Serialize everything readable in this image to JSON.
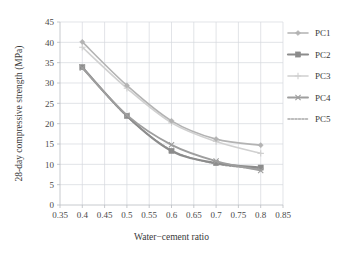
{
  "chart_data": {
    "type": "line",
    "title": "",
    "xlabel": "Water−cement ratio",
    "ylabel": "28-day compressive strength (MPa)",
    "xlim": [
      0.35,
      0.85
    ],
    "ylim": [
      0,
      45
    ],
    "xticks": [
      "0.35",
      "0.4",
      "0.45",
      "0.5",
      "0.55",
      "0.6",
      "0.65",
      "0.7",
      "0.75",
      "0.8",
      "0.85"
    ],
    "yticks": [
      "0",
      "5",
      "10",
      "15",
      "20",
      "25",
      "30",
      "35",
      "40",
      "45"
    ],
    "grid": true,
    "legend_position": "right",
    "x": [
      0.4,
      0.5,
      0.6,
      0.7,
      0.8
    ],
    "series": [
      {
        "name": "PC1",
        "values": [
          40.1,
          29.4,
          20.7,
          16.2,
          14.7
        ],
        "color": "#b3b3b3",
        "marker": "diamond",
        "dash": "none",
        "width": 1.6
      },
      {
        "name": "PC2",
        "values": [
          33.9,
          21.9,
          13.3,
          10.3,
          9.2
        ],
        "color": "#8c8c8c",
        "marker": "square",
        "dash": "none",
        "width": 2.2
      },
      {
        "name": "PC3",
        "values": [
          38.8,
          28.7,
          20.2,
          15.6,
          12.7
        ],
        "color": "#d0d0d0",
        "marker": "plus",
        "dash": "none",
        "width": 1.6
      },
      {
        "name": "PC4",
        "values": [
          33.7,
          22.1,
          14.8,
          10.8,
          8.5
        ],
        "color": "#9e9e9e",
        "marker": "cross",
        "dash": "none",
        "width": 1.9
      },
      {
        "name": "PC5",
        "values": [
          33.8,
          21.8,
          13.5,
          10.1,
          8.9
        ],
        "color": "#a8a8a8",
        "marker": "none",
        "dash": "2,1.5",
        "width": 1.5
      }
    ]
  },
  "legend": {
    "items": [
      {
        "label": "PC1"
      },
      {
        "label": "PC2"
      },
      {
        "label": "PC3"
      },
      {
        "label": "PC4"
      },
      {
        "label": "PC5"
      }
    ]
  },
  "colors": {
    "grid": "#d6d9de",
    "axis": "#b9bcc1",
    "text": "#3a3a3a",
    "background": "#ffffff"
  }
}
